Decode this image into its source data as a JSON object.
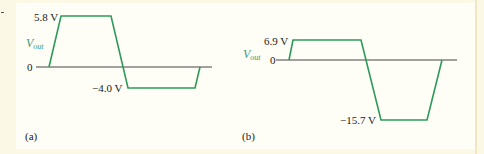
{
  "figure": {
    "colors": {
      "background": "#fbf8e6",
      "panel": "#fefdf6",
      "waveform": "#2e9a5c",
      "axis": "#444444",
      "vout_label": "#3a9a7a",
      "text": "#222222"
    },
    "panels": [
      {
        "id": "a",
        "caption": "(a)",
        "vout_label": "V",
        "vout_sub": "out",
        "zero_label": "0",
        "high_label": "5.8 V",
        "low_label": "−4.0 V",
        "high_value": 5.8,
        "low_value": -4.0
      },
      {
        "id": "b",
        "caption": "(b)",
        "vout_label": "V",
        "vout_sub": "out",
        "zero_label": "0",
        "high_label": "6.9 V",
        "low_label": "−15.7 V",
        "high_value": 6.9,
        "low_value": -15.7
      }
    ]
  }
}
